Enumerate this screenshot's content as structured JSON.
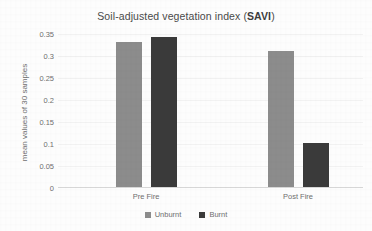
{
  "chart_data": {
    "type": "bar",
    "title": "Soil-adjusted vegetation index (SAVI)",
    "title_plain": "Soil-adjusted vegetation index (",
    "title_emphasis": "SAVI",
    "title_tail": ")",
    "categories": [
      "Pre Fire",
      "Post Fire"
    ],
    "series": [
      {
        "name": "Unburnt",
        "color": "#8c8c8c",
        "values": [
          0.33,
          0.31
        ]
      },
      {
        "name": "Burnt",
        "color": "#3a3a3a",
        "values": [
          0.34,
          0.1
        ]
      }
    ],
    "xlabel": "",
    "ylabel": "mean values of 30 samples",
    "ylim": [
      0,
      0.35
    ],
    "ytick_values": [
      0.35,
      0.3,
      0.25,
      0.2,
      0.15,
      0.1,
      0.05,
      0
    ],
    "ytick_labels": [
      "0.35",
      "0.3",
      "0.25",
      "0.2",
      "0.15",
      "0.1",
      "0.05",
      "0"
    ],
    "grid": true,
    "legend_position": "bottom"
  },
  "colors": {
    "unburnt": "#8c8c8c",
    "burnt": "#3a3a3a",
    "axis": "#d7d7d7",
    "grid": "#f2f2f2",
    "text": "#6f6f6f",
    "title": "#4a4a4a",
    "background": "#fdfdfd"
  }
}
